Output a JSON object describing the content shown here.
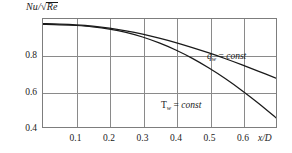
{
  "chart_data": {
    "type": "line",
    "title": "",
    "subtitle": "",
    "ylabel": "Nu/√Re",
    "ylabel_parts": {
      "numerator": "Nu",
      "slash": "/",
      "radical": "√",
      "radicand": "Re"
    },
    "xlabel": "x/D",
    "xlim": [
      0,
      0.702
    ],
    "ylim": [
      0.4,
      0.982
    ],
    "grid": true,
    "grid_axes": "both",
    "legend_position": "inline-annotations",
    "xticks": [
      0.1,
      0.2,
      0.3,
      0.4,
      0.5,
      0.6
    ],
    "xtick_labels": [
      "0.1",
      "0.2",
      "0.3",
      "0.4",
      "0.5",
      "0.6"
    ],
    "yticks": [
      0.4,
      0.6,
      0.8
    ],
    "ytick_labels": [
      "0.4",
      "0.6",
      "0.8"
    ],
    "series": [
      {
        "name": "q_w = const",
        "label_symbol": "q",
        "label_subscript": "w",
        "label_equals": "=",
        "label_value": "const",
        "color": "#1a1a1a",
        "x": [
          0.0,
          0.05,
          0.1,
          0.15,
          0.2,
          0.25,
          0.3,
          0.35,
          0.4,
          0.45,
          0.5,
          0.55,
          0.6,
          0.65,
          0.702
        ],
        "y": [
          0.957,
          0.955,
          0.951,
          0.944,
          0.933,
          0.918,
          0.9,
          0.879,
          0.855,
          0.828,
          0.799,
          0.768,
          0.735,
          0.7,
          0.663
        ]
      },
      {
        "name": "T_w = const",
        "label_symbol": "T",
        "label_subscript": "w",
        "label_equals": "=",
        "label_value": "const",
        "color": "#1a1a1a",
        "x": [
          0.0,
          0.05,
          0.1,
          0.15,
          0.2,
          0.25,
          0.3,
          0.35,
          0.4,
          0.45,
          0.5,
          0.55,
          0.6,
          0.65,
          0.702
        ],
        "y": [
          0.953,
          0.951,
          0.947,
          0.94,
          0.928,
          0.91,
          0.885,
          0.853,
          0.815,
          0.77,
          0.718,
          0.66,
          0.596,
          0.527,
          0.45
        ]
      }
    ],
    "annotations": [
      {
        "text": "q_w = const",
        "x": 0.545,
        "y": 0.808
      },
      {
        "text": "T_w = const",
        "x": 0.4,
        "y": 0.56
      }
    ]
  },
  "axis": {
    "y_ticks": [
      {
        "label": "0.8",
        "value": 0.8
      },
      {
        "label": "0.6",
        "value": 0.6
      },
      {
        "label": "0.4",
        "value": 0.4
      }
    ],
    "x_ticks": [
      {
        "label": "0.1",
        "value": 0.1
      },
      {
        "label": "0.2",
        "value": 0.2
      },
      {
        "label": "0.3",
        "value": 0.3
      },
      {
        "label": "0.4",
        "value": 0.4
      },
      {
        "label": "0.5",
        "value": 0.5
      },
      {
        "label": "0.6",
        "value": 0.6
      }
    ],
    "x_axis_title": "x/D"
  },
  "labels": {
    "y_axis_title_numerator": "Nu",
    "y_axis_title_slash": "/",
    "y_axis_title_radical": "√",
    "y_axis_title_radicand": "Re",
    "curve_qw_symbol": "q",
    "curve_qw_subscript": "w",
    "curve_qw_equals": "=",
    "curve_qw_const": "const",
    "curve_tw_symbol": "T",
    "curve_tw_subscript": "w",
    "curve_tw_equals": "=",
    "curve_tw_const": "const"
  },
  "colors": {
    "curve": "#1a1a1a",
    "grid": "#8a8a8a",
    "frame": "#7d7d7d",
    "text": "#1a1a1a",
    "background": "#ffffff"
  }
}
